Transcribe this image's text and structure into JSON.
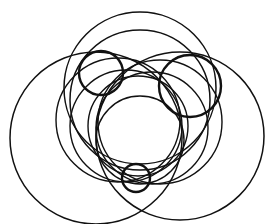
{
  "figure": {
    "width": 272,
    "height": 224,
    "background": "#ffffff",
    "stroke_color": "#111111",
    "circles": [
      {
        "id": "large-left",
        "cx": 96,
        "cy": 138,
        "r": 86,
        "w": 1.5
      },
      {
        "id": "large-right",
        "cx": 180,
        "cy": 136,
        "r": 84,
        "w": 1.5
      },
      {
        "id": "top-large",
        "cx": 140,
        "cy": 88,
        "r": 76,
        "w": 1.5
      },
      {
        "id": "top-second",
        "cx": 140,
        "cy": 100,
        "r": 70,
        "w": 1.5
      },
      {
        "id": "mid-left-a",
        "cx": 118,
        "cy": 120,
        "r": 62,
        "w": 1.4
      },
      {
        "id": "mid-left-b",
        "cx": 126,
        "cy": 126,
        "r": 56,
        "w": 1.4
      },
      {
        "id": "mid-right-a",
        "cx": 160,
        "cy": 122,
        "r": 62,
        "w": 1.4
      },
      {
        "id": "mid-right-b",
        "cx": 152,
        "cy": 128,
        "r": 56,
        "w": 1.4
      },
      {
        "id": "center-oval-a",
        "cx": 138,
        "cy": 126,
        "r": 50,
        "w": 1.4
      },
      {
        "id": "center-oval-b",
        "cx": 140,
        "cy": 140,
        "r": 44,
        "w": 1.4
      },
      {
        "id": "small-left",
        "cx": 101,
        "cy": 73,
        "r": 22,
        "w": 2.4
      },
      {
        "id": "small-right",
        "cx": 190,
        "cy": 86,
        "r": 31,
        "w": 2.4
      },
      {
        "id": "small-bottom",
        "cx": 136,
        "cy": 178,
        "r": 14,
        "w": 2.4
      }
    ]
  }
}
